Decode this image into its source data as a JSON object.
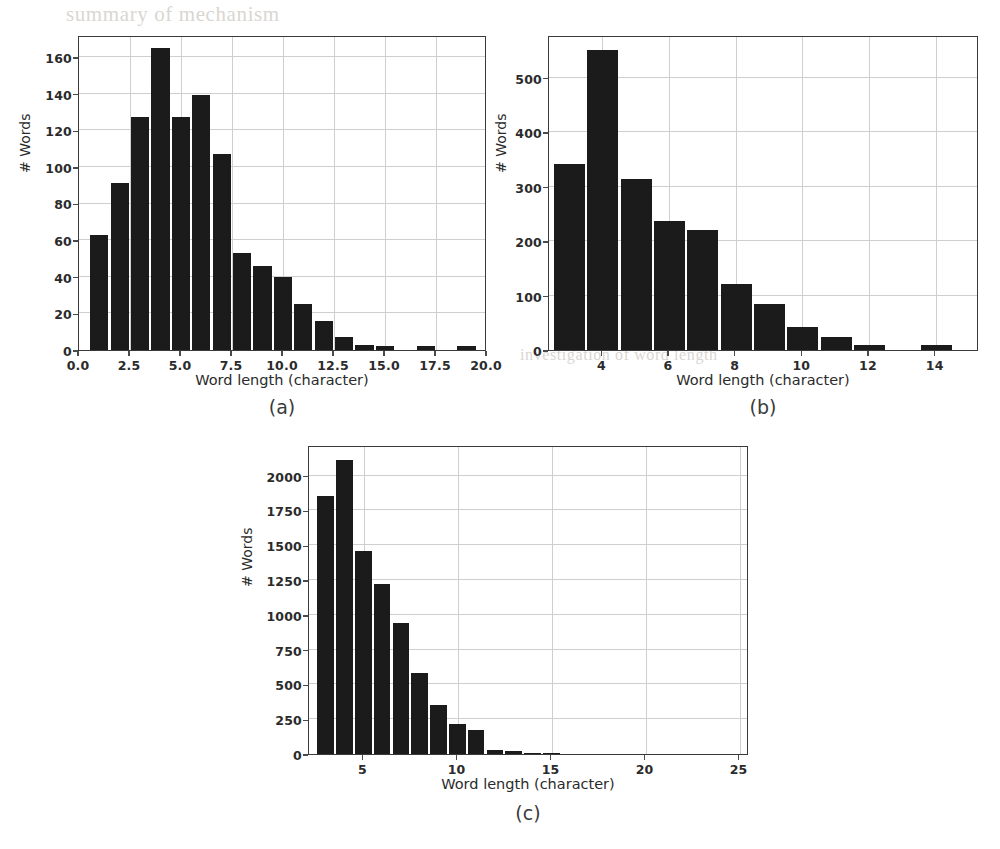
{
  "figure": {
    "background": "#ffffff",
    "bar_color": "#1b1b1b",
    "grid_color": "#cfcfcf",
    "axis_color": "#3a3a3a"
  },
  "ghost_text": {
    "line1": "summary of mechanism",
    "line2": "as of the",
    "line3": "of normal conditions",
    "line4": "determined",
    "line5": "at 2 km altitude",
    "line6": "is a measure of",
    "line7": "numbers",
    "line8": "by the",
    "line9": "investigation of word length"
  },
  "panels": [
    {
      "id": "a",
      "caption": "(a)",
      "xlabel": "Word length (character)",
      "ylabel": "# Words"
    },
    {
      "id": "b",
      "caption": "(b)",
      "xlabel": "Word length (character)",
      "ylabel": "# Words"
    },
    {
      "id": "c",
      "caption": "(c)",
      "xlabel": "Word length (character)",
      "ylabel": "# Words"
    }
  ],
  "chart_data": [
    {
      "panel": "a",
      "type": "bar",
      "title": "",
      "xlabel": "Word length (character)",
      "ylabel": "# Words",
      "xlim": [
        0.0,
        20.0
      ],
      "ylim": [
        0,
        172
      ],
      "grid": true,
      "legend": null,
      "xticks": [
        "0.0",
        "2.5",
        "5.0",
        "7.5",
        "10.0",
        "12.5",
        "15.0",
        "17.5",
        "20.0"
      ],
      "xtick_values": [
        0.0,
        2.5,
        5.0,
        7.5,
        10.0,
        12.5,
        15.0,
        17.5,
        20.0
      ],
      "yticks": [
        "0",
        "20",
        "40",
        "60",
        "80",
        "100",
        "120",
        "140",
        "160"
      ],
      "ytick_values": [
        0,
        20,
        40,
        60,
        80,
        100,
        120,
        140,
        160
      ],
      "bin_edges": [
        0.55,
        1.55,
        2.55,
        3.55,
        4.55,
        5.55,
        6.55,
        7.55,
        8.55,
        9.55,
        10.55,
        11.55,
        12.55,
        13.55,
        14.55,
        15.55,
        16.55,
        17.55,
        18.55,
        19.55
      ],
      "categories": [
        1,
        2,
        3,
        4,
        5,
        6,
        7,
        8,
        9,
        10,
        11,
        12,
        13,
        14,
        15,
        16,
        17,
        18,
        19
      ],
      "values": [
        63,
        91,
        127,
        165,
        127,
        139,
        107,
        53,
        46,
        40,
        25,
        16,
        7,
        3,
        2,
        0,
        2,
        0,
        2
      ]
    },
    {
      "panel": "b",
      "type": "bar",
      "title": "",
      "xlabel": "Word length (character)",
      "ylabel": "# Words",
      "xlim": [
        2.4,
        15.3
      ],
      "ylim": [
        0,
        578
      ],
      "grid": true,
      "legend": null,
      "xticks": [
        "4",
        "6",
        "8",
        "10",
        "12",
        "14"
      ],
      "xtick_values": [
        4,
        6,
        8,
        10,
        12,
        14
      ],
      "yticks": [
        "0",
        "100",
        "200",
        "300",
        "400",
        "500"
      ],
      "ytick_values": [
        0,
        100,
        200,
        300,
        400,
        500
      ],
      "bin_edges": [
        2.55,
        3.55,
        4.55,
        5.55,
        6.55,
        7.55,
        8.55,
        9.55,
        10.55,
        11.55,
        12.55,
        13.55,
        14.55
      ],
      "categories": [
        3,
        4,
        5,
        6,
        7,
        8,
        9,
        10,
        11,
        12,
        13,
        14
      ],
      "values": [
        342,
        550,
        313,
        236,
        220,
        121,
        84,
        42,
        24,
        9,
        0,
        9
      ]
    },
    {
      "panel": "c",
      "type": "bar",
      "title": "",
      "xlabel": "Word length (character)",
      "ylabel": "# Words",
      "xlim": [
        2.1,
        25.5
      ],
      "ylim": [
        0,
        2220
      ],
      "grid": true,
      "legend": null,
      "xticks": [
        "5",
        "10",
        "15",
        "20",
        "25"
      ],
      "xtick_values": [
        5,
        10,
        15,
        20,
        25
      ],
      "yticks": [
        "0",
        "250",
        "500",
        "750",
        "1000",
        "1250",
        "1500",
        "1750",
        "2000"
      ],
      "ytick_values": [
        0,
        250,
        500,
        750,
        1000,
        1250,
        1500,
        1750,
        2000
      ],
      "bin_edges": [
        2.55,
        3.55,
        4.55,
        5.55,
        6.55,
        7.55,
        8.55,
        9.55,
        10.55,
        11.55,
        12.55,
        13.55,
        14.55,
        15.55
      ],
      "categories": [
        3,
        4,
        5,
        6,
        7,
        8,
        9,
        10,
        11,
        12,
        13,
        14,
        15
      ],
      "values": [
        1855,
        2115,
        1460,
        1220,
        940,
        580,
        350,
        215,
        175,
        30,
        25,
        8,
        3
      ]
    }
  ]
}
